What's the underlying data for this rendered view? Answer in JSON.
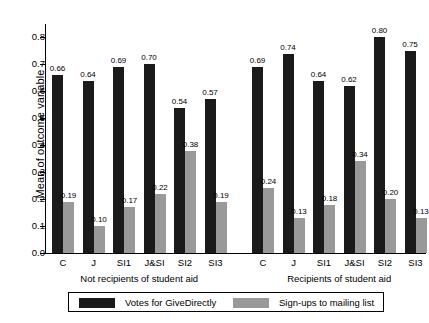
{
  "chart_data": {
    "type": "bar",
    "title": "",
    "xlabel": "",
    "ylabel": "Mean of outcome variable",
    "ylim": [
      0.0,
      0.85
    ],
    "yticks": [
      "0.0",
      "0.1",
      "0.2",
      "0.3",
      "0.4",
      "0.5",
      "0.6",
      "0.7",
      "0.8"
    ],
    "ytick_values": [
      0.0,
      0.1,
      0.2,
      0.3,
      0.4,
      0.5,
      0.6,
      0.7,
      0.8
    ],
    "grid": false,
    "legend_position": "bottom",
    "panels": [
      {
        "name": "Not recipients of student aid",
        "categories": [
          "C",
          "J",
          "SI1",
          "J&SI",
          "SI2",
          "SI3"
        ]
      },
      {
        "name": "Recipients of student aid",
        "categories": [
          "C",
          "J",
          "SI1",
          "J&SI",
          "SI2",
          "SI3"
        ]
      }
    ],
    "categories": [
      "C",
      "J",
      "SI1",
      "J&SI",
      "SI2",
      "SI3",
      "C",
      "J",
      "SI1",
      "J&SI",
      "SI2",
      "SI3"
    ],
    "series": [
      {
        "name": "Votes for GiveDirectly",
        "color": "#1a1a1a",
        "values": [
          0.66,
          0.64,
          0.69,
          0.7,
          0.54,
          0.57,
          0.69,
          0.74,
          0.64,
          0.62,
          0.8,
          0.75
        ],
        "labels": [
          "0.66",
          "0.64",
          "0.69",
          "0.70",
          "0.54",
          "0.57",
          "0.69",
          "0.74",
          "0.64",
          "0.62",
          "0.80",
          "0.75"
        ]
      },
      {
        "name": "Sign-ups to mailing list",
        "color": "#999999",
        "values": [
          0.19,
          0.1,
          0.17,
          0.22,
          0.38,
          0.19,
          0.24,
          0.13,
          0.18,
          0.34,
          0.2,
          0.13
        ],
        "labels": [
          "0.19",
          "0.10",
          "0.17",
          "0.22",
          "0.38",
          "0.19",
          "0.24",
          "0.13",
          "0.18",
          "0.34",
          "0.20",
          "0.13"
        ]
      }
    ]
  },
  "legend": {
    "items": [
      {
        "label": "Votes for GiveDirectly",
        "color": "#1a1a1a"
      },
      {
        "label": "Sign-ups to mailing list",
        "color": "#999999"
      }
    ]
  }
}
